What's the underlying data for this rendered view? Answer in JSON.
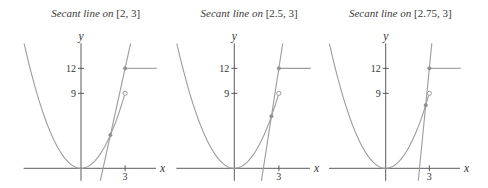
{
  "figure": {
    "panels": [
      {
        "title_prefix": "Secant line on",
        "title_interval": "[2, 3]",
        "xlabel": "x",
        "ylabel": "y",
        "xtick_labels": [
          "3"
        ],
        "ytick_labels": [
          "12",
          "9"
        ]
      },
      {
        "title_prefix": "Secant line on",
        "title_interval": "[2.5, 3]",
        "xlabel": "x",
        "ylabel": "y",
        "xtick_labels": [
          "3"
        ],
        "ytick_labels": [
          "12",
          "9"
        ]
      },
      {
        "title_prefix": "Secant line on",
        "title_interval": "[2.75, 3]",
        "xlabel": "x",
        "ylabel": "y",
        "xtick_labels": [
          "3"
        ],
        "ytick_labels": [
          "12",
          "9"
        ]
      }
    ]
  },
  "colors": {
    "axes": "#4a4a4a",
    "curve": "#9c9c9c",
    "text": "#333333"
  },
  "chart_data": [
    {
      "type": "line",
      "title": "Secant line on [2, 3]",
      "xlabel": "x",
      "ylabel": "y",
      "xticks": [
        3
      ],
      "yticks": [
        9,
        12
      ],
      "xlim": [
        -3.9,
        5.1
      ],
      "ylim": [
        -1.5,
        15
      ],
      "grid": false,
      "function": {
        "pieces": [
          {
            "expr": "x^2",
            "domain": [
              -3.87,
              3
            ],
            "right_endpoint": "open",
            "open_point": [
              3,
              9
            ]
          },
          {
            "expr": "12",
            "domain": [
              3,
              5.15
            ],
            "left_endpoint": "closed",
            "closed_point": [
              3,
              12
            ]
          }
        ]
      },
      "secant": {
        "interval": [
          2,
          3
        ],
        "points": [
          [
            2,
            4
          ],
          [
            3,
            12
          ]
        ],
        "slope": 8
      }
    },
    {
      "type": "line",
      "title": "Secant line on [2.5, 3]",
      "xlabel": "x",
      "ylabel": "y",
      "xticks": [
        3
      ],
      "yticks": [
        9,
        12
      ],
      "xlim": [
        -3.9,
        5.1
      ],
      "ylim": [
        -1.5,
        15
      ],
      "grid": false,
      "function": {
        "pieces": [
          {
            "expr": "x^2",
            "domain": [
              -3.87,
              3
            ],
            "right_endpoint": "open",
            "open_point": [
              3,
              9
            ]
          },
          {
            "expr": "12",
            "domain": [
              3,
              5.15
            ],
            "left_endpoint": "closed",
            "closed_point": [
              3,
              12
            ]
          }
        ]
      },
      "secant": {
        "interval": [
          2.5,
          3
        ],
        "points": [
          [
            2.5,
            6.25
          ],
          [
            3,
            12
          ]
        ],
        "slope": 11.5
      }
    },
    {
      "type": "line",
      "title": "Secant line on [2.75, 3]",
      "xlabel": "x",
      "ylabel": "y",
      "xticks": [
        3
      ],
      "yticks": [
        9,
        12
      ],
      "xlim": [
        -3.9,
        5.1
      ],
      "ylim": [
        -1.5,
        15
      ],
      "grid": false,
      "function": {
        "pieces": [
          {
            "expr": "x^2",
            "domain": [
              -3.87,
              3
            ],
            "right_endpoint": "open",
            "open_point": [
              3,
              9
            ]
          },
          {
            "expr": "12",
            "domain": [
              3,
              5.15
            ],
            "left_endpoint": "closed",
            "closed_point": [
              3,
              12
            ]
          }
        ]
      },
      "secant": {
        "interval": [
          2.75,
          3
        ],
        "points": [
          [
            2.75,
            7.5625
          ],
          [
            3,
            12
          ]
        ],
        "slope": 17.75
      }
    }
  ]
}
